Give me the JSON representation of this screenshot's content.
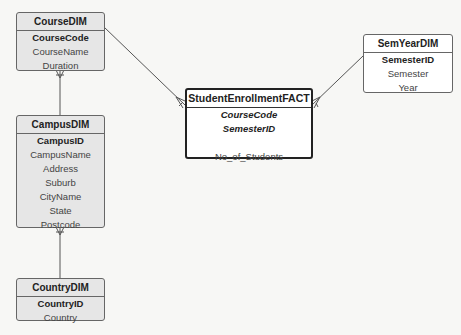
{
  "diagram": {
    "type": "star-schema ER diagram",
    "notation": "crow's foot"
  },
  "entities": {
    "course": {
      "title": "CourseDIM",
      "primary_key": "CourseCode",
      "attributes": [
        "CourseName",
        "Duration"
      ]
    },
    "campus": {
      "title": "CampusDIM",
      "primary_key": "CampusID",
      "attributes": [
        "CampusName",
        "Address",
        "Suburb",
        "CityName",
        "State",
        "Postcode"
      ]
    },
    "country": {
      "title": "CountryDIM",
      "primary_key": "CountryID",
      "attributes": [
        "Country"
      ]
    },
    "semyear": {
      "title": "SemYearDIM",
      "primary_key": "SemesterID",
      "attributes": [
        "Semester",
        "Year"
      ]
    },
    "fact": {
      "title": "StudentEnrollmentFACT",
      "foreign_keys": [
        "CourseCode",
        "SemesterID"
      ],
      "measures": [
        "No_of_Students"
      ]
    }
  },
  "relationships": [
    {
      "from": "CourseDIM",
      "to": "StudentEnrollmentFACT",
      "many_end": "StudentEnrollmentFACT"
    },
    {
      "from": "SemYearDIM",
      "to": "StudentEnrollmentFACT",
      "many_end": "StudentEnrollmentFACT"
    },
    {
      "from": "CampusDIM",
      "to": "CourseDIM",
      "many_end": "CourseDIM"
    },
    {
      "from": "CountryDIM",
      "to": "CampusDIM",
      "many_end": "CampusDIM"
    }
  ],
  "colors": {
    "background": "#f7f7f5",
    "dimension_fill": "#e6e6e6",
    "fact_fill": "#ffffff",
    "line": "#555555"
  }
}
